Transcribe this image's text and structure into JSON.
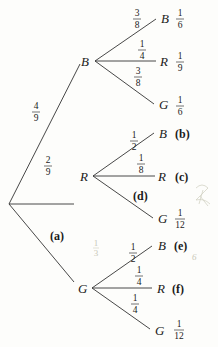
{
  "diagram": {
    "type": "probability-tree",
    "root": {
      "branches": [
        {
          "node": "B",
          "prob": {
            "num": "4",
            "den": "9"
          },
          "children": [
            {
              "node": "B",
              "prob": {
                "num": "3",
                "den": "8"
              },
              "result": {
                "num": "1",
                "den": "6"
              }
            },
            {
              "node": "R",
              "prob": {
                "num": "1",
                "den": "4"
              },
              "result": {
                "num": "1",
                "den": "9"
              }
            },
            {
              "node": "G",
              "prob": {
                "num": "3",
                "den": "8"
              },
              "result": {
                "num": "1",
                "den": "6"
              }
            }
          ]
        },
        {
          "node": "R",
          "prob": {
            "num": "2",
            "den": "9"
          },
          "children": [
            {
              "node": "B",
              "prob": {
                "num": "1",
                "den": "2"
              },
              "result_label": "(b)"
            },
            {
              "node": "R",
              "prob": {
                "num": "1",
                "den": "8"
              },
              "result_label": "(c)"
            },
            {
              "node": "G",
              "prob_label": "(d)",
              "result": {
                "num": "1",
                "den": "12"
              }
            }
          ]
        },
        {
          "node": "G",
          "prob_label": "(a)",
          "children": [
            {
              "node": "B",
              "prob": {
                "num": "1",
                "den": "2"
              },
              "result_label": "(e)"
            },
            {
              "node": "R",
              "prob": {
                "num": "1",
                "den": "4"
              },
              "result_label": "(f)"
            },
            {
              "node": "G",
              "prob": {
                "num": "1",
                "den": "4"
              },
              "result": {
                "num": "1",
                "den": "12"
              }
            }
          ]
        }
      ]
    },
    "handwritten_marks": {
      "frac_num": "1",
      "frac_den": "3",
      "side_mark": "6"
    }
  }
}
